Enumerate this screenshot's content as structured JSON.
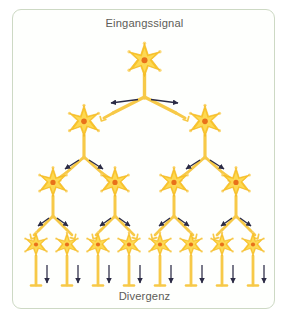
{
  "figure": {
    "input_label": "Eingangssignal",
    "output_label": "Divergenz",
    "frame_border_color": "#cdd9c4",
    "background_color": "#ffffff",
    "label_color": "#5d5d58"
  },
  "diagram": {
    "type": "neural-divergence-tree",
    "soma_color": "#f9c42a",
    "soma_highlight_color": "#fdd954",
    "soma_edge_color": "#f2b622",
    "nucleus_color": "#e8711a",
    "axon_color": "#f7c948",
    "axon_edge_color": "#efb528",
    "dendrite_color": "#fbd97a",
    "arrow_color": "#2b2b45",
    "rows": [
      {
        "level": 1,
        "count": 1,
        "y": 61
      },
      {
        "level": 2,
        "count": 2,
        "y": 122
      },
      {
        "level": 3,
        "count": 4,
        "y": 183
      },
      {
        "level": 4,
        "count": 8,
        "y": 245
      }
    ],
    "fanout": 2,
    "neuron_count_total": 15
  }
}
